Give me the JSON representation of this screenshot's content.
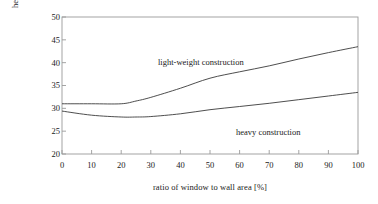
{
  "chart_data": {
    "type": "line",
    "title": "",
    "xlabel": "ratio of window to wall area  [%]",
    "ylabel_line1": "heating requirement",
    "ylabel_line2": "[kWh/m²]",
    "xlim": [
      0,
      100
    ],
    "ylim": [
      20,
      50
    ],
    "xticks": [
      "0",
      "10",
      "20",
      "30",
      "40",
      "50",
      "60",
      "70",
      "80",
      "90",
      "100"
    ],
    "yticks": [
      "20",
      "25",
      "30",
      "35",
      "40",
      "45",
      "50"
    ],
    "grid": false,
    "legend": "inline-annotations",
    "x": [
      0,
      10,
      20,
      25,
      30,
      40,
      50,
      60,
      70,
      80,
      90,
      100
    ],
    "series": [
      {
        "name": "light-weight construction",
        "values": [
          31.0,
          31.0,
          31.0,
          31.6,
          32.4,
          34.4,
          36.6,
          38.0,
          39.3,
          40.8,
          42.2,
          43.5
        ]
      },
      {
        "name": "heavy construction",
        "values": [
          29.4,
          28.5,
          28.1,
          28.1,
          28.2,
          28.8,
          29.7,
          30.4,
          31.1,
          31.9,
          32.7,
          33.5
        ]
      }
    ],
    "annotations": [
      {
        "text": "light-weight construction",
        "x": 23,
        "y": 38.5
      },
      {
        "text": "heavy construction",
        "x": 52,
        "y": 24.6
      }
    ],
    "colors": {
      "line": "#3a3a3a",
      "axis": "#808080",
      "background": "#ffffff"
    }
  }
}
